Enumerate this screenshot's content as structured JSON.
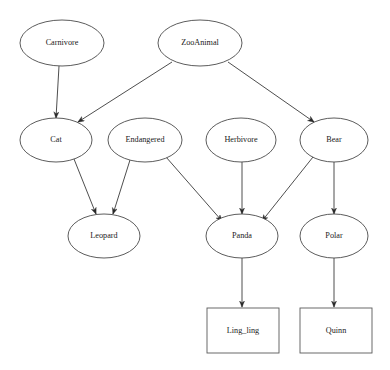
{
  "diagram": {
    "type": "ontology-class-hierarchy",
    "background_color": "#ffffff",
    "node_stroke_color": "#4a4a4a",
    "edge_color": "#3a3a3a",
    "label_color": "#1a1a1a",
    "nodes": [
      {
        "id": "carnivore",
        "label": "Carnivore",
        "shape": "ellipse",
        "cx": 62,
        "cy": 43,
        "rx": 42,
        "ry": 23
      },
      {
        "id": "zooanimal",
        "label": "ZooAnimal",
        "shape": "ellipse",
        "cx": 200,
        "cy": 43,
        "rx": 42,
        "ry": 23
      },
      {
        "id": "cat",
        "label": "Cat",
        "shape": "ellipse",
        "cx": 56,
        "cy": 140,
        "rx": 36,
        "ry": 22
      },
      {
        "id": "endangered",
        "label": "Endangered",
        "shape": "ellipse",
        "cx": 145,
        "cy": 140,
        "rx": 37,
        "ry": 22
      },
      {
        "id": "herbivore",
        "label": "Herbivore",
        "shape": "ellipse",
        "cx": 241,
        "cy": 140,
        "rx": 35,
        "ry": 22
      },
      {
        "id": "bear",
        "label": "Bear",
        "shape": "ellipse",
        "cx": 334,
        "cy": 140,
        "rx": 34,
        "ry": 22
      },
      {
        "id": "leopard",
        "label": "Leopard",
        "shape": "ellipse",
        "cx": 104,
        "cy": 236,
        "rx": 36,
        "ry": 22
      },
      {
        "id": "panda",
        "label": "Panda",
        "shape": "ellipse",
        "cx": 242,
        "cy": 236,
        "rx": 36,
        "ry": 22
      },
      {
        "id": "polar",
        "label": "Polar",
        "shape": "ellipse",
        "cx": 334,
        "cy": 236,
        "rx": 34,
        "ry": 22
      },
      {
        "id": "ling_ling",
        "label": "Ling_ling",
        "shape": "rectangle",
        "x": 207,
        "y": 308,
        "w": 72,
        "h": 45
      },
      {
        "id": "quinn",
        "label": "Quinn",
        "shape": "rectangle",
        "x": 300,
        "y": 308,
        "w": 72,
        "h": 45
      }
    ],
    "edges": [
      {
        "from": "carnivore",
        "to": "cat",
        "x1": 59,
        "y1": 66,
        "x2": 56,
        "y2": 118
      },
      {
        "from": "zooanimal",
        "to": "cat",
        "x1": 172,
        "y1": 62,
        "x2": 78,
        "y2": 122
      },
      {
        "from": "zooanimal",
        "to": "bear",
        "x1": 228,
        "y1": 62,
        "x2": 314,
        "y2": 122
      },
      {
        "from": "cat",
        "to": "leopard",
        "x1": 74,
        "y1": 159,
        "x2": 96,
        "y2": 214
      },
      {
        "from": "endangered",
        "to": "leopard",
        "x1": 130,
        "y1": 160,
        "x2": 113,
        "y2": 214
      },
      {
        "from": "endangered",
        "to": "panda",
        "x1": 166,
        "y1": 157,
        "x2": 222,
        "y2": 221
      },
      {
        "from": "herbivore",
        "to": "panda",
        "x1": 242,
        "y1": 162,
        "x2": 242,
        "y2": 214
      },
      {
        "from": "bear",
        "to": "panda",
        "x1": 313,
        "y1": 157,
        "x2": 262,
        "y2": 221
      },
      {
        "from": "bear",
        "to": "polar",
        "x1": 334,
        "y1": 162,
        "x2": 334,
        "y2": 214
      },
      {
        "from": "panda",
        "to": "ling_ling",
        "x1": 242,
        "y1": 258,
        "x2": 242,
        "y2": 307
      },
      {
        "from": "polar",
        "to": "quinn",
        "x1": 334,
        "y1": 258,
        "x2": 334,
        "y2": 307
      }
    ]
  }
}
